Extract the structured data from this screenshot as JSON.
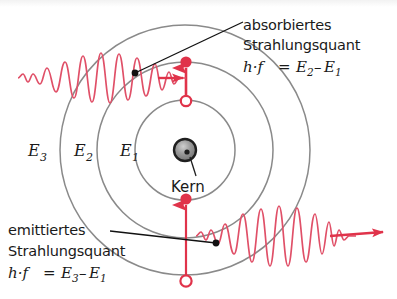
{
  "figure": {
    "width": 397,
    "height": 299,
    "background": "#ffffff"
  },
  "colors": {
    "orbit": "#8a8a8a",
    "quantum_red": "#e0334a",
    "wave_red": "#e05068",
    "leader_line": "#111111",
    "nucleus_fill": "#2b2b2b",
    "nucleus_highlight": "#b9b9b9",
    "text": "#1a1a1a",
    "top_band": "#f2f2f2"
  },
  "nucleus": {
    "label": "Kern",
    "cx": 185,
    "cy": 150,
    "r": 11
  },
  "orbits": [
    {
      "name": "E1",
      "label": "E",
      "sub": "1",
      "r": 50,
      "label_x": 120,
      "label_y": 156
    },
    {
      "name": "E2",
      "label": "E",
      "sub": "2",
      "r": 88,
      "label_x": 74,
      "label_y": 156
    },
    {
      "name": "E3",
      "label": "E",
      "sub": "3",
      "r": 125,
      "label_x": 28,
      "label_y": 156
    }
  ],
  "annotations": {
    "absorbed": {
      "line1": "absorbiertes",
      "line2": "Strahlungsquant",
      "formula_lhs": "h·f",
      "formula_eq": "=",
      "formula_e_first": "E",
      "formula_sub_first": "2",
      "formula_minus": "–",
      "formula_e_second": "E",
      "formula_sub_second": "1",
      "text_x": 243,
      "line1_y": 30,
      "line2_y": 50,
      "formula_y": 72,
      "leader_from_x": 135,
      "leader_from_y": 73,
      "leader_to_x": 240,
      "leader_to_y": 24
    },
    "emitted": {
      "line1": "emittiertes",
      "line2": "Strahlungsquant",
      "formula_lhs": "h·f",
      "formula_eq": "=",
      "formula_e_first": "E",
      "formula_sub_first": "3",
      "formula_minus": "–",
      "formula_e_second": "E",
      "formula_sub_second": "1",
      "text_x": 8,
      "line1_y": 235,
      "line2_y": 256,
      "formula_y": 278,
      "leader_from_x": 112,
      "leader_from_y": 232,
      "leader_to_x": 216,
      "leader_to_y": 243
    }
  },
  "transitions": {
    "absorption": {
      "name": "absorption-transition",
      "direction": "up",
      "x": 186,
      "filled_dot_y": 63,
      "open_circle_y": 101,
      "from_level": "E1",
      "to_level": "E2"
    },
    "emission": {
      "name": "emission-transition",
      "direction": "up",
      "x": 186,
      "filled_dot_y": 199,
      "open_circle_y": 281,
      "from_level": "E3",
      "to_level": "E1"
    }
  },
  "waves": {
    "incoming": {
      "name": "incoming-photon-wave",
      "description": "Wellenzug von links nach rechts, absorbiert",
      "start_x": 18,
      "end_x": 178,
      "baseline_y": 78,
      "peak_amplitude": 27,
      "cycles": 11,
      "arrow_direction": "right"
    },
    "outgoing": {
      "name": "outgoing-photon-wave",
      "description": "Wellenzug von links nach rechts, emittiert",
      "start_x": 196,
      "end_x": 385,
      "baseline_y": 235,
      "peak_amplitude": 30,
      "cycles": 11,
      "arrow_direction": "right"
    }
  }
}
